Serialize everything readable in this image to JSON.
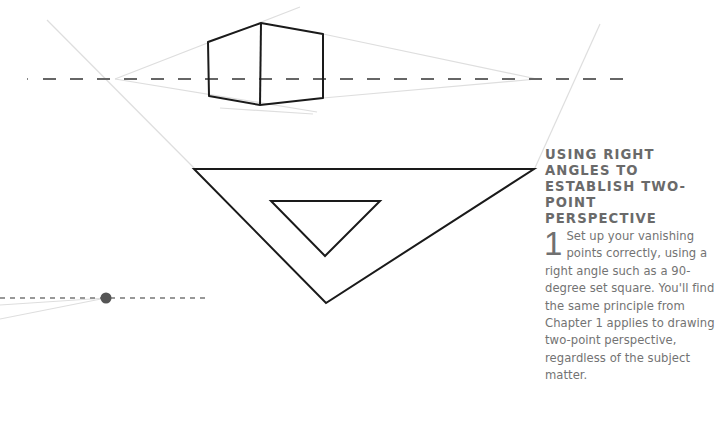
{
  "caption": {
    "title_lines": [
      "USING RIGHT ANGLES TO",
      "ESTABLISH TWO-POINT",
      "PERSPECTIVE"
    ],
    "step_number": "1",
    "body": "Set up your vanishing points correctly, using a right angle such as a 90-degree set square. You'll find the same principle from Chapter 1 applies to drawing two-point perspective, regardless of the subject matter."
  },
  "colors": {
    "outline": "#1a1a1a",
    "horizon": "#666666",
    "construction": "#dddddd",
    "vanishing_point": "#555555",
    "text": "#6d6d6d"
  },
  "illustration": {
    "horizon_y": 79,
    "left_vanishing_point": [
      115,
      79
    ],
    "right_vanishing_point": [
      537,
      79
    ],
    "box_vertices": [
      [
        208,
        42
      ],
      [
        261,
        23
      ],
      [
        323,
        34
      ],
      [
        323,
        98
      ],
      [
        260,
        105
      ],
      [
        209,
        96
      ]
    ],
    "set_square_outer": [
      [
        194,
        169
      ],
      [
        534,
        169
      ],
      [
        326,
        303
      ]
    ],
    "set_square_inner": [
      [
        271,
        201
      ],
      [
        380,
        201
      ],
      [
        325,
        256
      ]
    ],
    "secondary_horizon_y": 298,
    "secondary_vanishing_point": [
      106,
      298
    ]
  }
}
